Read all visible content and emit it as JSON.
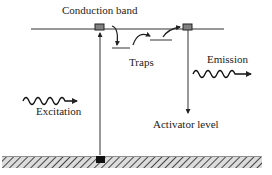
{
  "diagram": {
    "type": "energy-level diagram (phosphorescence / trapping)",
    "labels": {
      "conduction_band": "Conduction band",
      "traps": "Traps",
      "emission": "Emission",
      "excitation": "Excitation",
      "activator_level": "Activator level"
    },
    "colors": {
      "line": "#333333",
      "box_fill": "#808080",
      "ground_square": "#111111",
      "hatch": "#555555"
    }
  }
}
